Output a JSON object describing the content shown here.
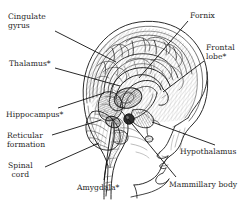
{
  "figure": {
    "background_color": "#ffffff",
    "ink_color": "#262626",
    "leader_line_color": "#111111",
    "width": 251,
    "height": 200,
    "illustration": {
      "name": "sagittal-brain-illustration",
      "style": "pen-and-ink hatched engraving",
      "view": "mid-sagittal section of human head facing right",
      "features": [
        "cerebral cortex with gyri and sulci",
        "corpus callosum arch",
        "fornix",
        "thalamus",
        "hypothalamus and mammillary body",
        "hippocampus and amygdala",
        "brainstem with reticular formation",
        "spinal cord",
        "cerebellum",
        "facial profile with nose, lips and chin"
      ]
    }
  },
  "labels": [
    {
      "id": "cingulate-gyrus",
      "text": "Cingulate\ngyrus",
      "lines": [
        "Cingulate",
        "gyrus"
      ],
      "asterisk": false,
      "x": 8,
      "y": 12,
      "align": "left",
      "leader": {
        "x1": 55,
        "y1": 31,
        "x2": 116,
        "y2": 62
      }
    },
    {
      "id": "thalamus",
      "text": "Thalamus*",
      "lines": [
        "Thalamus*"
      ],
      "asterisk": true,
      "x": 9,
      "y": 59,
      "align": "left",
      "leader": {
        "x1": 55,
        "y1": 68,
        "x2": 120,
        "y2": 86
      }
    },
    {
      "id": "hippocampus",
      "text": "Hippocampus*",
      "lines": [
        "Hippocampus*"
      ],
      "asterisk": true,
      "x": 6,
      "y": 110,
      "align": "left",
      "leader": {
        "x1": 58,
        "y1": 108,
        "x2": 104,
        "y2": 93
      }
    },
    {
      "id": "reticular-formation",
      "text": "Reticular\nformation",
      "lines": [
        "Reticular",
        "formation"
      ],
      "asterisk": false,
      "x": 7,
      "y": 131,
      "align": "left",
      "leader": {
        "x1": 52,
        "y1": 135,
        "x2": 101,
        "y2": 120
      }
    },
    {
      "id": "spinal-cord",
      "text": "Spinal\ncord",
      "lines": [
        "Spinal",
        "cord"
      ],
      "asterisk": false,
      "x": 8,
      "y": 161,
      "align": "left",
      "leader": {
        "x1": 45,
        "y1": 167,
        "x2": 99,
        "y2": 143
      }
    },
    {
      "id": "amygdala",
      "text": "Amygdala*",
      "lines": [
        "Amygdala*"
      ],
      "asterisk": true,
      "x": 77,
      "y": 183,
      "align": "left",
      "leader": {
        "x1": 104,
        "y1": 180,
        "x2": 112,
        "y2": 122
      }
    },
    {
      "id": "fornix",
      "text": "Fornix",
      "lines": [
        "Fornix"
      ],
      "asterisk": false,
      "x": 190,
      "y": 11,
      "align": "left",
      "leader": {
        "x1": 188,
        "y1": 21,
        "x2": 139,
        "y2": 78
      }
    },
    {
      "id": "frontal-lobe",
      "text": "Frontal\nlobe*",
      "lines": [
        "Frontal",
        "lobe*"
      ],
      "asterisk": true,
      "x": 206,
      "y": 43,
      "align": "left",
      "leader": {
        "x1": 204,
        "y1": 61,
        "x2": 163,
        "y2": 92
      }
    },
    {
      "id": "hypothalamus",
      "text": "Hypothalamus",
      "lines": [
        "Hypothalamus"
      ],
      "asterisk": false,
      "x": 180,
      "y": 147,
      "align": "left",
      "leader": {
        "x1": 215,
        "y1": 145,
        "x2": 152,
        "y2": 122
      }
    },
    {
      "id": "mammillary-body",
      "text": "Mammillary body",
      "lines": [
        "Mammillary body"
      ],
      "asterisk": false,
      "x": 169,
      "y": 180,
      "align": "left",
      "leader": {
        "x1": 176,
        "y1": 177,
        "x2": 128,
        "y2": 119
      }
    }
  ]
}
